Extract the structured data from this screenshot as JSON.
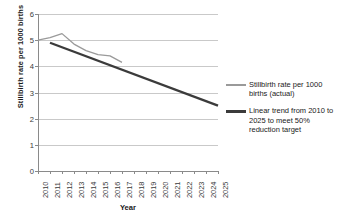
{
  "chart_data": {
    "type": "line",
    "title": "",
    "xlabel": "Year",
    "ylabel": "Stillbirth rate per 1000 births",
    "xlim": [
      2010,
      2025
    ],
    "ylim": [
      0,
      6
    ],
    "yticks": [
      0,
      1,
      2,
      3,
      4,
      5,
      6
    ],
    "grid": true,
    "legend_position": "right",
    "categories": [
      "2010",
      "2011",
      "2012",
      "2013",
      "2014",
      "2015",
      "2016",
      "2017",
      "2018",
      "2019",
      "2020",
      "2021",
      "2022",
      "2023",
      "2024",
      "2025"
    ],
    "series": [
      {
        "name": "Stillbirth rate per 1000 births (actual)",
        "key": "actual",
        "color": "#9a9a9a",
        "width": 1.3,
        "x": [
          2010,
          2011,
          2012,
          2013,
          2014,
          2015,
          2016,
          2017
        ],
        "values": [
          5.0,
          5.1,
          5.25,
          4.85,
          4.6,
          4.45,
          4.4,
          4.15
        ]
      },
      {
        "name": "Linear trend from 2010 to 2025 to meet 50% reduction target",
        "key": "trend",
        "color": "#3b3b3b",
        "width": 2.3,
        "x": [
          2011,
          2025
        ],
        "values": [
          4.9,
          2.5
        ]
      }
    ]
  },
  "legend": {
    "entries": [
      {
        "label": "Stillbirth rate per 1000\nbirths (actual)",
        "color": "#9a9a9a",
        "thickness": "1.6px"
      },
      {
        "label": "Linear trend from 2010 to\n2025 to meet 50%\nreduction target",
        "color": "#3b3b3b",
        "thickness": "2.6px"
      }
    ]
  },
  "axes": {
    "x_title": "Year",
    "y_title": "Stillbirth rate per 1000 births"
  }
}
